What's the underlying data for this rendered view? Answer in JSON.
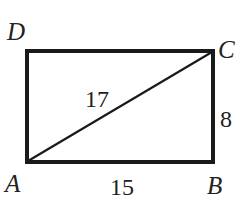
{
  "diagram": {
    "shape": "rectangle",
    "vertices": {
      "A": {
        "label": "A",
        "position": "bottom-left"
      },
      "B": {
        "label": "B",
        "position": "bottom-right"
      },
      "C": {
        "label": "C",
        "position": "top-right"
      },
      "D": {
        "label": "D",
        "position": "top-left"
      }
    },
    "segments": {
      "AB": {
        "label": "15"
      },
      "BC": {
        "label": "8"
      },
      "AC": {
        "label": "17",
        "type": "diagonal"
      }
    },
    "colors": {
      "stroke": "#1a1a1a",
      "text": "#222222",
      "background": "#ffffff"
    }
  }
}
